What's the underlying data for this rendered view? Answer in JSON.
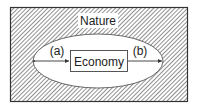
{
  "diagram": {
    "outer": {
      "label": "Nature"
    },
    "inner": {
      "label": "Economy"
    },
    "flows": [
      {
        "label": "(a)",
        "direction": "into economy"
      },
      {
        "label": "(b)",
        "direction": "out of economy"
      }
    ],
    "colors": {
      "stroke": "#333333",
      "hatch": "#555555",
      "background": "#ffffff"
    }
  }
}
